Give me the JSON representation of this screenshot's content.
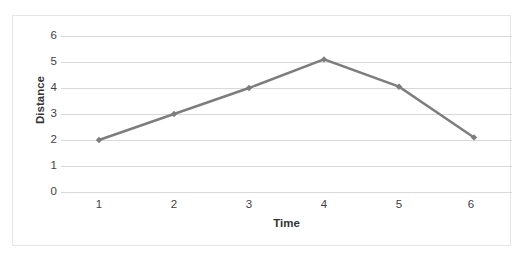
{
  "chart_data": {
    "type": "line",
    "title": "",
    "xlabel": "Time",
    "ylabel": "Distance",
    "categories": [
      "1",
      "2",
      "3",
      "4",
      "5",
      "6"
    ],
    "x": [
      1,
      2,
      3,
      4,
      5,
      6
    ],
    "values": [
      2.0,
      3.0,
      4.0,
      5.1,
      4.05,
      2.1
    ],
    "series": [
      {
        "name": "",
        "values": [
          2.0,
          3.0,
          4.0,
          5.1,
          4.05,
          2.1
        ],
        "color": "#7d7d7d",
        "marker": "diamond"
      }
    ],
    "ylim": [
      0,
      6
    ],
    "yticks": [
      "0",
      "1",
      "2",
      "3",
      "4",
      "5",
      "6"
    ],
    "ytick_values": [
      0,
      1,
      2,
      3,
      4,
      5,
      6
    ],
    "grid": "horizontal",
    "legend": "none"
  },
  "style": {
    "line_color": "#7d7d7d",
    "gridline_color": "#d9d9d9",
    "border_color": "#e6e6e6",
    "text_color": "#3f3f3f",
    "background": "#ffffff"
  }
}
